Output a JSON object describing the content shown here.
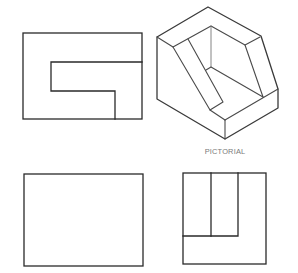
{
  "figure": {
    "views": [
      {
        "name": "top-view",
        "position": "upper-left"
      },
      {
        "name": "pictorial-view",
        "position": "upper-right"
      },
      {
        "name": "front-view",
        "position": "lower-left"
      },
      {
        "name": "side-view",
        "position": "lower-right"
      }
    ],
    "pictorial_label": "PICTORIAL",
    "colors": {
      "line": "#2a2a2a",
      "label": "#7a7a7a",
      "background": "#ffffff"
    }
  }
}
